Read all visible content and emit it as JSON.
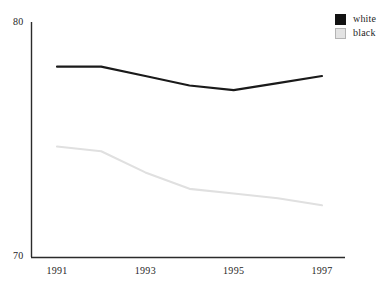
{
  "chart_data": {
    "type": "line",
    "title": "",
    "xlabel": "",
    "ylabel": "",
    "x": [
      1991,
      1992,
      1993,
      1994,
      1995,
      1996,
      1997
    ],
    "x_tick_labels": [
      "1991",
      "1993",
      "1995",
      "1997"
    ],
    "x_tick_values": [
      1991,
      1993,
      1995,
      1997
    ],
    "y_tick_labels": [
      "80",
      "70"
    ],
    "ylim": [
      70,
      80
    ],
    "xlim": [
      1991,
      1997
    ],
    "grid": false,
    "legend_position": "top-right",
    "series": [
      {
        "name": "white",
        "color": "#1a1a1a",
        "values": [
          78.1,
          78.1,
          77.7,
          77.3,
          77.1,
          77.4,
          77.7
        ]
      },
      {
        "name": "black",
        "color": "#e0e0e0",
        "values": [
          74.7,
          74.5,
          73.6,
          72.9,
          72.7,
          72.5,
          72.2
        ]
      }
    ]
  },
  "axis": {
    "y_top_label": "80",
    "y_bottom_label": "70"
  },
  "legend": {
    "entries": [
      {
        "label": "white",
        "swatch": "black-filled-square"
      },
      {
        "label": "black",
        "swatch": "light-gray-square"
      }
    ]
  },
  "x_ticks": [
    {
      "label": "1991",
      "value": 1991
    },
    {
      "label": "1993",
      "value": 1993
    },
    {
      "label": "1995",
      "value": 1995
    },
    {
      "label": "1997",
      "value": 1997
    }
  ]
}
